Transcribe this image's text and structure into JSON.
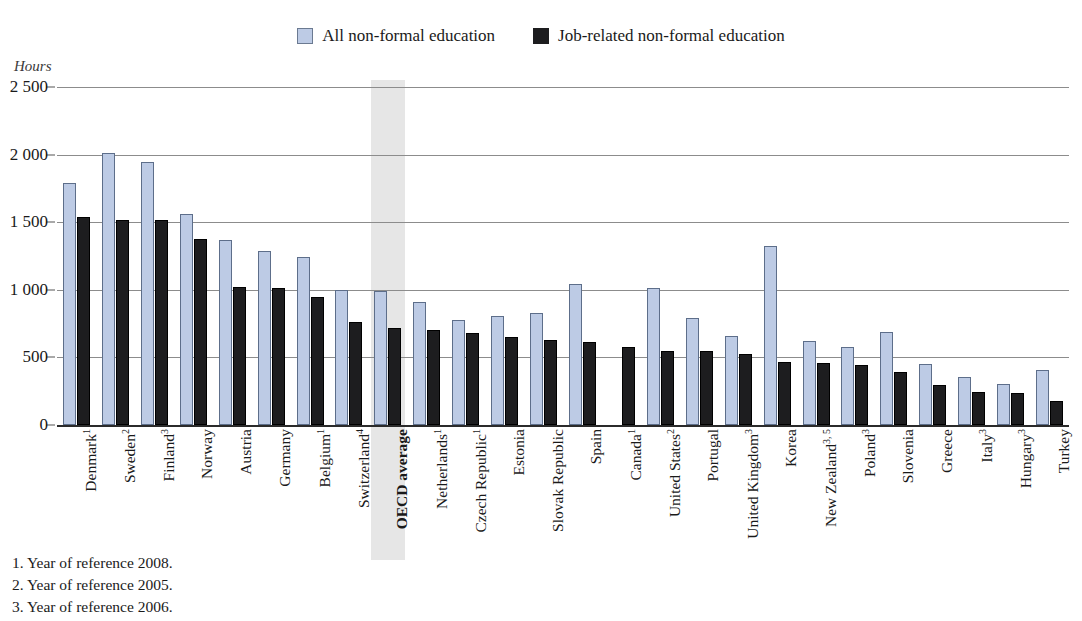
{
  "chart_data": {
    "type": "bar",
    "title": "",
    "xlabel": "",
    "ylabel": "Hours",
    "ylim": [
      0,
      2500
    ],
    "yticks": [
      0,
      500,
      1000,
      1500,
      2000,
      2500
    ],
    "ytick_labels": [
      "0",
      "500",
      "1 000",
      "1 500",
      "2 000",
      "2 500"
    ],
    "grid": true,
    "legend_position": "top-center",
    "highlight_category": "OECD average",
    "categories": [
      "Denmark",
      "Sweden",
      "Finland",
      "Norway",
      "Austria",
      "Germany",
      "Belgium",
      "Switzerland",
      "OECD average",
      "Netherlands",
      "Czech Republic",
      "Estonia",
      "Slovak Republic",
      "Spain",
      "Canada",
      "United States",
      "Portugal",
      "United Kingdom",
      "Korea",
      "New Zealand",
      "Poland",
      "Slovenia",
      "Greece",
      "Italy",
      "Hungary",
      "Turkey"
    ],
    "category_footnotes": [
      "1",
      "2",
      "3",
      "",
      "",
      "",
      "1",
      "4",
      "",
      "1",
      "1",
      "",
      "",
      "",
      "1",
      "2",
      "",
      "3",
      "",
      "3, 5",
      "3",
      "",
      "",
      "3",
      "3",
      ""
    ],
    "series": [
      {
        "name": "All non-formal education",
        "color": "#bdcbe5",
        "values": [
          1790,
          2010,
          1945,
          1560,
          1365,
          1290,
          1245,
          1000,
          990,
          910,
          780,
          805,
          825,
          1040,
          null,
          1015,
          790,
          655,
          1325,
          620,
          580,
          690,
          450,
          355,
          305,
          410
        ]
      },
      {
        "name": "Job-related non-formal education",
        "color": "#1d1d1f",
        "values": [
          1540,
          1520,
          1515,
          1375,
          1020,
          1015,
          945,
          760,
          720,
          705,
          680,
          650,
          630,
          615,
          580,
          545,
          545,
          525,
          465,
          455,
          445,
          390,
          295,
          245,
          240,
          175
        ]
      }
    ]
  },
  "legend": {
    "items": [
      {
        "label": "All non-formal education",
        "swatch": "all"
      },
      {
        "label": "Job-related non-formal education",
        "swatch": "job"
      }
    ]
  },
  "axis": {
    "units_label": "Hours"
  },
  "footnotes": [
    "1. Year of reference 2008.",
    "2. Year of reference 2005.",
    "3. Year of reference 2006."
  ]
}
